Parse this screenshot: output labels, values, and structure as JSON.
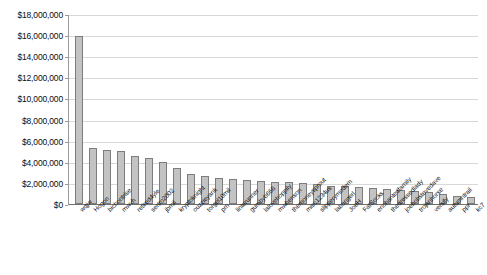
{
  "chart_data": {
    "type": "bar",
    "title": "",
    "xlabel": "",
    "ylabel": "",
    "ylim": [
      0,
      18000000
    ],
    "grid": true,
    "legend": false,
    "y_tick_labels": [
      "$18,000,000",
      "$16,000,000",
      "$14,000,000",
      "$12,000,000",
      "$10,000,000",
      "$8,000,000",
      "$6,000,000",
      "$4,000,000",
      "$2,000,000",
      "$0"
    ],
    "y_tick_values": [
      18000000,
      16000000,
      14000000,
      12000000,
      10000000,
      8000000,
      6000000,
      4000000,
      2000000,
      0
    ],
    "categories": [
      "wqjw",
      "Hogon",
      "bichontrise",
      "mwvh",
      "retired4yle",
      "sertro2002",
      "jbmil",
      "kryptoknight",
      "ouzzieyank",
      "torgel10mil",
      "pm",
      "linterunner",
      "gumbyb666",
      "lalovehoppily",
      "mwhenson",
      "themoneysprout",
      "misc1234us",
      "slipperymodem",
      "labongerl",
      "JoeH",
      "FatSocks",
      "enchantedfamily",
      "thedressedlady",
      "joebobstevedave",
      "trojanhorse",
      "versify",
      "autumntrail",
      "ppr",
      "kc7"
    ],
    "values": [
      15950000,
      5300000,
      5150000,
      5050000,
      4550000,
      4400000,
      4000000,
      3450000,
      2850000,
      2700000,
      2450000,
      2350000,
      2250000,
      2150000,
      2100000,
      2050000,
      1950000,
      1850000,
      1750000,
      1700000,
      1600000,
      1500000,
      1400000,
      1300000,
      1200000,
      1100000,
      950000,
      800000,
      650000
    ],
    "series_color": "#c3c3c3",
    "series_border_color": "#7d7d7d",
    "gridline_color": "#d8d8d8",
    "axis_color": "#9a9a9a"
  }
}
